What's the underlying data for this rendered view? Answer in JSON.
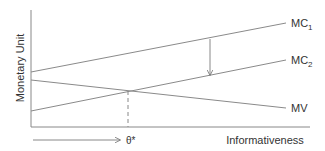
{
  "diagram": {
    "y_axis_label": "Monetary Unit",
    "x_axis_label": "Informativeness",
    "optimum_label": "θ*",
    "curves": [
      {
        "id": "mc1",
        "label_main": "MC",
        "label_sub": "1",
        "x1": 31,
        "y1": 72,
        "x2": 286,
        "y2": 23
      },
      {
        "id": "mc2",
        "label_main": "MC",
        "label_sub": "2",
        "x1": 31,
        "y1": 111,
        "x2": 286,
        "y2": 60
      },
      {
        "id": "mv",
        "label_main": "MV",
        "label_sub": "",
        "x1": 31,
        "y1": 80,
        "x2": 286,
        "y2": 108
      }
    ],
    "colors": {
      "axis": "#888888",
      "line": "#8a8a8a",
      "text": "#333333"
    }
  }
}
